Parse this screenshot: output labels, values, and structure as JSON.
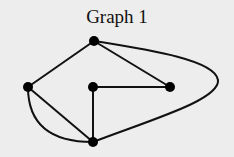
{
  "title": "Graph 1",
  "nodes": [
    {
      "id": "top",
      "x": 94,
      "y": 41
    },
    {
      "id": "left",
      "x": 28,
      "y": 87
    },
    {
      "id": "middle",
      "x": 93,
      "y": 87
    },
    {
      "id": "right",
      "x": 170,
      "y": 87
    },
    {
      "id": "bottom",
      "x": 93,
      "y": 142
    }
  ],
  "edges": [
    [
      "top",
      "left"
    ],
    [
      "top",
      "right"
    ],
    [
      "top",
      "bottom",
      "curved-around-right"
    ],
    [
      "left",
      "bottom"
    ],
    [
      "left",
      "bottom",
      "curved"
    ],
    [
      "middle",
      "right"
    ],
    [
      "middle",
      "bottom"
    ]
  ]
}
